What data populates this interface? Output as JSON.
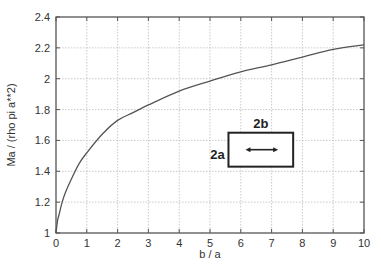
{
  "chart_data": {
    "type": "line",
    "title": "",
    "xlabel": "b / a",
    "ylabel": "Ma / (rho pi a**2)",
    "xlim": [
      0,
      10
    ],
    "ylim": [
      1,
      2.4
    ],
    "grid": true,
    "legend": null,
    "x_ticks": [
      0,
      1,
      2,
      3,
      4,
      5,
      6,
      7,
      8,
      9,
      10
    ],
    "x_tick_labels": [
      "0",
      "1",
      "2",
      "3",
      "4",
      "5",
      "6",
      "7",
      "8",
      "9",
      "10"
    ],
    "y_ticks": [
      1,
      1.2,
      1.4,
      1.6,
      1.8,
      2,
      2.2,
      2.4
    ],
    "y_tick_labels": [
      "1",
      "1.2",
      "1.4",
      "1.6",
      "1.8",
      "2",
      "2.2",
      "2.4"
    ],
    "series": [
      {
        "name": "added mass",
        "x": [
          0,
          0.05,
          0.1,
          0.2,
          0.3,
          0.5,
          0.75,
          1,
          1.5,
          2,
          2.5,
          3,
          4,
          5,
          6,
          7,
          8,
          9,
          10
        ],
        "y": [
          1.0,
          1.08,
          1.12,
          1.2,
          1.26,
          1.35,
          1.45,
          1.52,
          1.64,
          1.73,
          1.78,
          1.83,
          1.92,
          1.985,
          2.045,
          2.09,
          2.14,
          2.19,
          2.22
        ]
      }
    ],
    "annotations": [
      {
        "text": "2b",
        "type": "label",
        "position": "above rectangle"
      },
      {
        "text": "2a",
        "type": "label",
        "position": "left of rectangle"
      },
      {
        "type": "rectangle",
        "x_range": [
          5.6,
          7.7
        ],
        "y_range": [
          1.43,
          1.65
        ]
      },
      {
        "type": "double-arrow",
        "inside": "rectangle"
      }
    ]
  },
  "colors": {
    "axes": "#555555",
    "grid": "#bbbbbb",
    "curve": "#555555",
    "diagram": "#222222"
  }
}
